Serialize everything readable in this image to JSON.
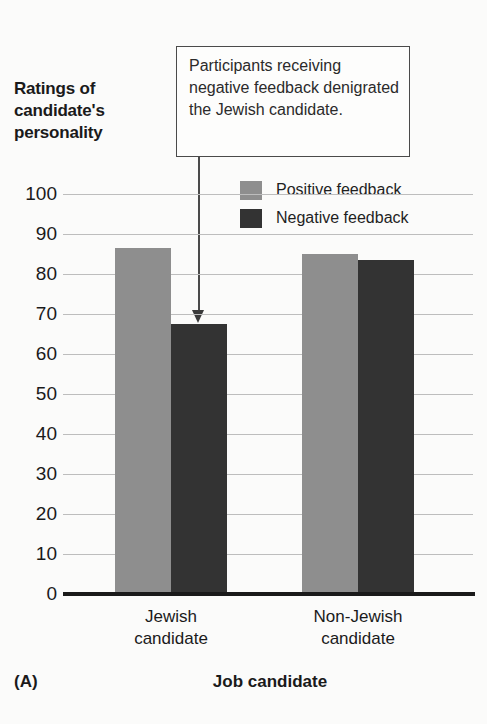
{
  "panel_label": "(A)",
  "callout": {
    "text": "Participants receiving negative feedback denigrated the Jewish candidate.",
    "border_color": "#4a4a4a"
  },
  "legend": {
    "items": [
      {
        "label": "Positive feedback",
        "color": "#8e8e8e"
      },
      {
        "label": "Negative feedback",
        "color": "#333333"
      }
    ]
  },
  "colors": {
    "positive": "#8e8e8e",
    "negative": "#333333",
    "axis": "#1a1a1a",
    "grid": "#bdbdbd",
    "background": "#fbfbfa"
  },
  "chart_data": {
    "type": "bar",
    "title": "",
    "ylabel": "Ratings of candidate's personality",
    "xlabel": "Job candidate",
    "categories": [
      "Jewish candidate",
      "Non-Jewish candidate"
    ],
    "category_lines": [
      [
        "Jewish",
        "candidate"
      ],
      [
        "Non-Jewish",
        "candidate"
      ]
    ],
    "series": [
      {
        "name": "Positive feedback",
        "color": "#8e8e8e",
        "values": [
          86.5,
          85.0
        ]
      },
      {
        "name": "Negative feedback",
        "color": "#333333",
        "values": [
          67.5,
          83.5
        ]
      }
    ],
    "ylim": [
      0,
      100
    ],
    "yticks": [
      0,
      10,
      20,
      30,
      40,
      50,
      60,
      70,
      80,
      90,
      100
    ],
    "ytick_labels": [
      "0",
      "10",
      "20",
      "30",
      "40",
      "50",
      "60",
      "70",
      "80",
      "90",
      "100"
    ],
    "grid": true,
    "legend_position": "upper-right-inside"
  }
}
